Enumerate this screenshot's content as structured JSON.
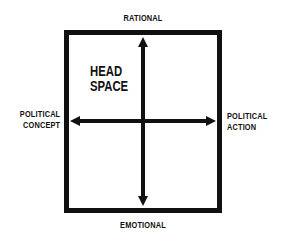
{
  "diagram": {
    "labels": {
      "top": "RATIONAL",
      "bottom": "EMOTIONAL",
      "left_line1": "POLITICAL",
      "left_line2": "CONCEPT",
      "right_line1": "POLITICAL",
      "right_line2": "ACTION"
    },
    "quadrant_label": {
      "line1": "HEAD",
      "line2": "SPACE"
    },
    "colors": {
      "ink": "#111111",
      "background": "#ffffff"
    }
  }
}
